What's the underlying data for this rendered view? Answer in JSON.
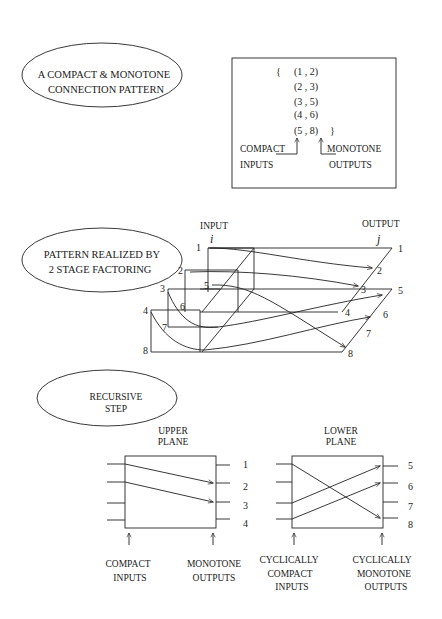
{
  "section1": {
    "ellipse_label": [
      "A COMPACT & MONOTONE",
      "CONNECTION PATTERN"
    ],
    "set_open": "{",
    "set_close": "}",
    "pairs": [
      "(1 , 2)",
      "(2 , 3)",
      "(3 , 5)",
      "(4 , 6)",
      "(5 , 8)"
    ],
    "inputs_label": [
      "COMPACT",
      "INPUTS"
    ],
    "outputs_label": [
      "MONOTONE",
      "OUTPUTS"
    ]
  },
  "section2": {
    "ellipse_label": [
      "PATTERN REALIZED BY",
      "2 STAGE FACTORING"
    ],
    "input_label": "INPUT",
    "input_var": "i",
    "output_label": "OUTPUT",
    "output_var": "j",
    "input_numbers": [
      "1",
      "2",
      "3",
      "4",
      "5",
      "6",
      "7",
      "8"
    ],
    "output_numbers": [
      "1",
      "2",
      "3",
      "4",
      "5",
      "6",
      "7",
      "8"
    ],
    "connections": [
      [
        1,
        2
      ],
      [
        2,
        3
      ],
      [
        3,
        5
      ],
      [
        4,
        6
      ],
      [
        5,
        8
      ]
    ]
  },
  "section3": {
    "ellipse_label": [
      "RECURSIVE",
      "STEP"
    ],
    "upper": {
      "title": [
        "UPPER",
        "PLANE"
      ],
      "outputs": [
        "1",
        "2",
        "3",
        "4"
      ],
      "inputs_label": [
        "COMPACT",
        "INPUTS"
      ],
      "outputs_label": [
        "MONOTONE",
        "OUTPUTS"
      ]
    },
    "lower": {
      "title": [
        "LOWER",
        "PLANE"
      ],
      "outputs": [
        "5",
        "6",
        "7",
        "8"
      ],
      "inputs_label": [
        "CYCLICALLY",
        "COMPACT",
        "INPUTS"
      ],
      "outputs_label": [
        "CYCLICALLY",
        "MONOTONE",
        "OUTPUTS"
      ]
    }
  }
}
